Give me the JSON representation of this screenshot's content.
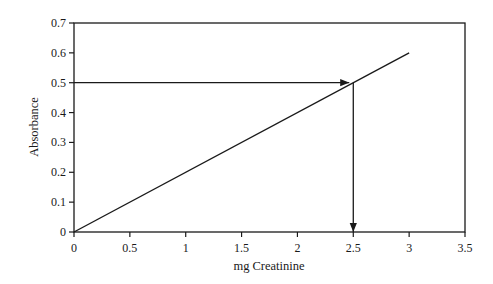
{
  "chart_data": {
    "type": "line",
    "title": "",
    "xlabel": "mg Creatinine",
    "ylabel": "Absorbance",
    "xlim": [
      0,
      3.5
    ],
    "ylim": [
      0,
      0.7
    ],
    "x_ticks": [
      0,
      0.5,
      1,
      1.5,
      2,
      2.5,
      3,
      3.5
    ],
    "x_tick_labels": [
      "0",
      "0.5",
      "1",
      "1.5",
      "2",
      "2.5",
      "3",
      "3.5"
    ],
    "y_ticks": [
      0,
      0.1,
      0.2,
      0.3,
      0.4,
      0.5,
      0.6,
      0.7
    ],
    "y_tick_labels": [
      "0",
      "0.1",
      "0.2",
      "0.3",
      "0.4",
      "0.5",
      "0.6",
      "0.7"
    ],
    "grid": false,
    "legend": null,
    "series": [
      {
        "name": "Standard curve",
        "x": [
          0,
          3
        ],
        "y": [
          0,
          0.6
        ],
        "color": "#1a1a1a"
      }
    ],
    "annotations": [
      {
        "type": "arrow",
        "from": [
          0,
          0.5
        ],
        "to": [
          2.5,
          0.5
        ],
        "description": "horizontal arrow from y-axis at absorbance 0.5 to the line"
      },
      {
        "type": "arrow",
        "from": [
          2.5,
          0.5
        ],
        "to": [
          2.5,
          0
        ],
        "description": "vertical arrow down from line to x-axis at 2.5 mg"
      }
    ]
  },
  "colors": {
    "ink": "#1a1a1a",
    "background": "#ffffff"
  }
}
